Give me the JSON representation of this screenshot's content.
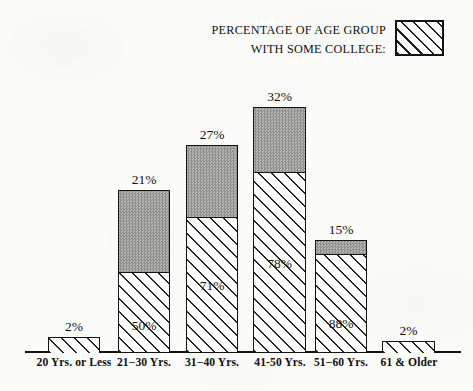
{
  "legend": {
    "line1": "PERCENTAGE OF AGE GROUP",
    "line2": "WITH SOME COLLEGE:",
    "swatch_name": "hatched-swatch"
  },
  "colors": {
    "ink": "#14130f",
    "solid_gray": "#a0a09c",
    "paper": "#fbfbfa"
  },
  "chart_data": {
    "type": "bar",
    "title": "",
    "subtitle": "",
    "xlabel": "",
    "ylabel": "",
    "stacked": true,
    "grid": false,
    "legend_position": "top-right",
    "categories": [
      "20 Yrs. or Less",
      "21−30 Yrs.",
      "31−40 Yrs.",
      "41-50 Yrs.",
      "51−60 Yrs.",
      "61 & Older"
    ],
    "series": [
      {
        "name": "WITH SOME COLLEGE",
        "pattern": "diagonal-hatch",
        "values": [
          null,
          50,
          71,
          78,
          88,
          null
        ],
        "labels": [
          "",
          "50%",
          "71%",
          "78%",
          "88%",
          ""
        ]
      },
      {
        "name": "Share of age group",
        "pattern": "solid-gray",
        "values": [
          2,
          21,
          27,
          32,
          15,
          2
        ],
        "labels": [
          "2%",
          "21%",
          "27%",
          "32%",
          "15%",
          "2%"
        ]
      }
    ],
    "bars": [
      {
        "category": "20 Yrs. or Less",
        "top_label": "2%",
        "inside_label": "",
        "gray_pct": 2,
        "hatch_pct": null,
        "px": {
          "left": 48,
          "width": 52,
          "top": 337,
          "split": 337,
          "bottom": 352
        }
      },
      {
        "category": "21−30 Yrs.",
        "top_label": "21%",
        "inside_label": "50%",
        "gray_pct": 21,
        "hatch_pct": 50,
        "px": {
          "left": 118,
          "width": 52,
          "top": 190,
          "split": 271,
          "bottom": 352
        }
      },
      {
        "category": "31−40 Yrs.",
        "top_label": "27%",
        "inside_label": "71%",
        "gray_pct": 27,
        "hatch_pct": 71,
        "px": {
          "left": 186,
          "width": 52,
          "top": 145,
          "split": 216,
          "bottom": 352
        }
      },
      {
        "category": "41-50 Yrs.",
        "top_label": "32%",
        "inside_label": "78%",
        "gray_pct": 32,
        "hatch_pct": 78,
        "px": {
          "left": 253,
          "width": 53,
          "top": 107,
          "split": 171,
          "bottom": 352
        }
      },
      {
        "category": "51−60 Yrs.",
        "top_label": "15%",
        "inside_label": "88%",
        "gray_pct": 15,
        "hatch_pct": 88,
        "px": {
          "left": 315,
          "width": 52,
          "top": 240,
          "split": 253,
          "bottom": 352
        }
      },
      {
        "category": "61 & Older",
        "top_label": "2%",
        "inside_label": "",
        "gray_pct": 2,
        "hatch_pct": null,
        "px": {
          "left": 382,
          "width": 53,
          "top": 341,
          "split": 341,
          "bottom": 352
        }
      }
    ],
    "axis_labels_px": [
      {
        "text": "20 Yrs. or Less",
        "center": 74
      },
      {
        "text": "21−30 Yrs.",
        "center": 144
      },
      {
        "text": "31−40 Yrs.",
        "center": 212
      },
      {
        "text": "41-50 Yrs.",
        "center": 280
      },
      {
        "text": "51−60 Yrs.",
        "center": 341
      },
      {
        "text": "61 & Older",
        "center": 409
      }
    ]
  }
}
